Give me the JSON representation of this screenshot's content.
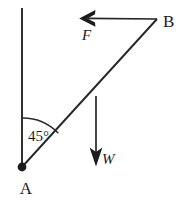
{
  "diagram": {
    "background_color": "#ffffff",
    "ink_color": "#1c1c1c",
    "points": [
      {
        "id": "A",
        "label": "A",
        "x": 22,
        "y": 167,
        "label_x": 26,
        "label_y": 194,
        "marker": "filled-dot"
      },
      {
        "id": "B",
        "label": "B",
        "x": 157,
        "y": 19,
        "label_x": 163,
        "label_y": 27,
        "marker": "none"
      }
    ],
    "angle": {
      "label": "45°",
      "value": 45,
      "unit": "degrees",
      "vertex": "A",
      "label_x": 28,
      "label_y": 141
    },
    "forces": [
      {
        "id": "F",
        "label": "F",
        "direction": "left",
        "from_x": 157,
        "from_y": 19,
        "to_x": 80,
        "to_y": 18,
        "label_x": 82,
        "label_y": 40
      },
      {
        "id": "W",
        "label": "W",
        "direction": "down",
        "from_x": 96,
        "from_y": 96,
        "to_x": 96,
        "to_y": 166,
        "label_x": 102,
        "label_y": 164
      }
    ],
    "segments": [
      {
        "id": "vertical-reference",
        "x1": 22,
        "y1": 8,
        "x2": 22,
        "y2": 167,
        "width": 1.8
      },
      {
        "id": "rod-AB",
        "x1": 22,
        "y1": 167,
        "x2": 157,
        "y2": 19,
        "width": 1.8
      }
    ]
  }
}
